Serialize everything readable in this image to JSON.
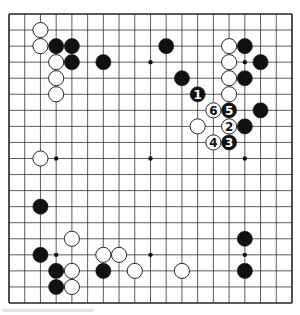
{
  "board": {
    "size": 19,
    "origin_px": [
      9,
      14
    ],
    "end_px": [
      292,
      303
    ],
    "line_color": "#333333",
    "border_color": "#222222",
    "background": "#ffffff",
    "hoshi": [
      [
        3,
        3
      ],
      [
        9,
        3
      ],
      [
        15,
        3
      ],
      [
        3,
        9
      ],
      [
        9,
        9
      ],
      [
        15,
        9
      ],
      [
        3,
        15
      ],
      [
        9,
        15
      ],
      [
        15,
        15
      ]
    ]
  },
  "stones": [
    {
      "color": "white",
      "col": 2,
      "row": 1
    },
    {
      "color": "white",
      "col": 2,
      "row": 2
    },
    {
      "color": "black",
      "col": 3,
      "row": 2
    },
    {
      "color": "black",
      "col": 4,
      "row": 2
    },
    {
      "color": "white",
      "col": 3,
      "row": 3
    },
    {
      "color": "black",
      "col": 4,
      "row": 3
    },
    {
      "color": "black",
      "col": 6,
      "row": 3
    },
    {
      "color": "white",
      "col": 3,
      "row": 4
    },
    {
      "color": "white",
      "col": 3,
      "row": 5
    },
    {
      "color": "black",
      "col": 10,
      "row": 2
    },
    {
      "color": "white",
      "col": 14,
      "row": 2
    },
    {
      "color": "black",
      "col": 15,
      "row": 2
    },
    {
      "color": "white",
      "col": 14,
      "row": 3
    },
    {
      "color": "black",
      "col": 16,
      "row": 3
    },
    {
      "color": "black",
      "col": 11,
      "row": 4
    },
    {
      "color": "white",
      "col": 14,
      "row": 4
    },
    {
      "color": "black",
      "col": 15,
      "row": 4
    },
    {
      "color": "black",
      "col": 12,
      "row": 5,
      "label": "1"
    },
    {
      "color": "white",
      "col": 14,
      "row": 5
    },
    {
      "color": "white",
      "col": 13,
      "row": 6,
      "label": "6"
    },
    {
      "color": "black",
      "col": 14,
      "row": 6,
      "label": "5"
    },
    {
      "color": "black",
      "col": 16,
      "row": 6
    },
    {
      "color": "white",
      "col": 12,
      "row": 7
    },
    {
      "color": "white",
      "col": 14,
      "row": 7,
      "label": "2"
    },
    {
      "color": "black",
      "col": 15,
      "row": 7
    },
    {
      "color": "white",
      "col": 13,
      "row": 8,
      "label": "4"
    },
    {
      "color": "black",
      "col": 14,
      "row": 8,
      "label": "3"
    },
    {
      "color": "white",
      "col": 2,
      "row": 9
    },
    {
      "color": "black",
      "col": 2,
      "row": 12
    },
    {
      "color": "white",
      "col": 4,
      "row": 14
    },
    {
      "color": "black",
      "col": 2,
      "row": 15
    },
    {
      "color": "white",
      "col": 6,
      "row": 15
    },
    {
      "color": "white",
      "col": 7,
      "row": 15
    },
    {
      "color": "black",
      "col": 3,
      "row": 16
    },
    {
      "color": "white",
      "col": 4,
      "row": 16
    },
    {
      "color": "black",
      "col": 6,
      "row": 16
    },
    {
      "color": "white",
      "col": 8,
      "row": 16
    },
    {
      "color": "black",
      "col": 3,
      "row": 17
    },
    {
      "color": "white",
      "col": 4,
      "row": 17
    },
    {
      "color": "black",
      "col": 15,
      "row": 14
    },
    {
      "color": "white",
      "col": 11,
      "row": 16
    },
    {
      "color": "black",
      "col": 15,
      "row": 16
    }
  ],
  "move_sequence": [
    "1",
    "2",
    "3",
    "4",
    "5",
    "6"
  ]
}
